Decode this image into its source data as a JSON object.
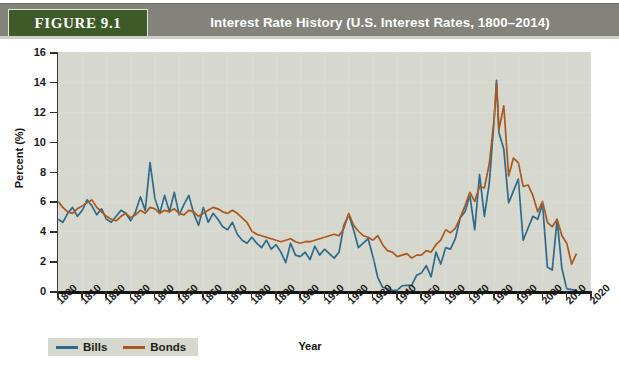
{
  "header": {
    "badge": "FIGURE 9.1",
    "title": "Interest Rate History (U.S. Interest Rates, 1800–2014)",
    "bar_color": "#83837b",
    "badge_color": "#3e5a28"
  },
  "legend": {
    "position": "bottom-left",
    "items": [
      {
        "label": "Bills",
        "color": "#2c6a8c"
      },
      {
        "label": "Bonds",
        "color": "#a9571f"
      }
    ]
  },
  "chart_data": {
    "type": "line",
    "title": "Interest Rate History (U.S. Interest Rates, 1800–2014)",
    "xlabel": "Year",
    "ylabel": "Percent (%)",
    "xlim": [
      1800,
      2020
    ],
    "ylim": [
      0,
      16
    ],
    "ytick_step": 2,
    "xtick_step": 10,
    "grid": false,
    "plot_bg": "#d6d7cd",
    "ytick_labels": [
      "0",
      "2",
      "4",
      "6",
      "8",
      "10",
      "12",
      "14",
      "16"
    ],
    "xtick_labels": [
      "1800",
      "1810",
      "1820",
      "1830",
      "1840",
      "1850",
      "1860",
      "1870",
      "1880",
      "1890",
      "1900",
      "1910",
      "1920",
      "1930",
      "1940",
      "1950",
      "1960",
      "1970",
      "1980",
      "1990",
      "2000",
      "2010",
      "2020"
    ],
    "series": [
      {
        "name": "Bills",
        "color": "#2c6a8c",
        "x": [
          1800,
          1802,
          1804,
          1806,
          1808,
          1810,
          1812,
          1814,
          1816,
          1818,
          1820,
          1822,
          1824,
          1826,
          1828,
          1830,
          1832,
          1834,
          1836,
          1838,
          1840,
          1842,
          1844,
          1846,
          1848,
          1850,
          1852,
          1854,
          1856,
          1858,
          1860,
          1862,
          1864,
          1866,
          1868,
          1870,
          1872,
          1874,
          1876,
          1878,
          1880,
          1882,
          1884,
          1886,
          1888,
          1890,
          1892,
          1894,
          1896,
          1898,
          1900,
          1902,
          1904,
          1906,
          1908,
          1910,
          1912,
          1914,
          1916,
          1918,
          1920,
          1922,
          1924,
          1926,
          1928,
          1930,
          1932,
          1934,
          1936,
          1938,
          1940,
          1942,
          1944,
          1946,
          1948,
          1950,
          1952,
          1954,
          1956,
          1958,
          1960,
          1962,
          1964,
          1966,
          1968,
          1970,
          1972,
          1974,
          1976,
          1978,
          1980,
          1981,
          1982,
          1984,
          1986,
          1988,
          1990,
          1992,
          1994,
          1996,
          1998,
          2000,
          2002,
          2004,
          2006,
          2008,
          2010,
          2012,
          2014
        ],
        "y": [
          4.8,
          4.6,
          5.2,
          5.6,
          5.0,
          5.4,
          6.1,
          5.7,
          5.1,
          5.5,
          4.8,
          4.6,
          5.0,
          5.4,
          5.2,
          4.7,
          5.3,
          6.3,
          5.4,
          8.6,
          6.2,
          5.2,
          6.4,
          5.3,
          6.6,
          5.1,
          5.8,
          6.4,
          5.2,
          4.4,
          5.6,
          4.6,
          5.2,
          4.8,
          4.3,
          4.1,
          4.6,
          3.8,
          3.4,
          3.2,
          3.6,
          3.2,
          2.9,
          3.4,
          2.8,
          3.1,
          2.6,
          1.9,
          3.2,
          2.4,
          2.3,
          2.6,
          2.1,
          3.0,
          2.4,
          2.8,
          2.5,
          2.2,
          2.6,
          4.4,
          5.1,
          4.1,
          2.9,
          3.2,
          3.5,
          2.3,
          0.9,
          0.25,
          0.15,
          0.05,
          0.05,
          0.35,
          0.38,
          0.38,
          1.05,
          1.2,
          1.7,
          0.95,
          2.6,
          1.8,
          2.9,
          2.8,
          3.5,
          4.9,
          5.3,
          6.4,
          4.1,
          7.8,
          5.0,
          7.2,
          11.4,
          14.1,
          10.6,
          9.5,
          5.9,
          6.7,
          7.5,
          3.4,
          4.2,
          5.0,
          4.8,
          5.8,
          1.6,
          1.4,
          4.8,
          1.5,
          0.14,
          0.09,
          0.04
        ]
      },
      {
        "name": "Bonds",
        "color": "#a9571f",
        "x": [
          1800,
          1802,
          1804,
          1806,
          1808,
          1810,
          1812,
          1814,
          1816,
          1818,
          1820,
          1822,
          1824,
          1826,
          1828,
          1830,
          1832,
          1834,
          1836,
          1838,
          1840,
          1842,
          1844,
          1846,
          1848,
          1850,
          1852,
          1854,
          1856,
          1858,
          1860,
          1862,
          1864,
          1866,
          1868,
          1870,
          1872,
          1874,
          1876,
          1878,
          1880,
          1882,
          1884,
          1886,
          1888,
          1890,
          1892,
          1894,
          1896,
          1898,
          1900,
          1902,
          1904,
          1906,
          1908,
          1910,
          1912,
          1914,
          1916,
          1918,
          1920,
          1922,
          1924,
          1926,
          1928,
          1930,
          1932,
          1934,
          1936,
          1938,
          1940,
          1942,
          1944,
          1946,
          1948,
          1950,
          1952,
          1954,
          1956,
          1958,
          1960,
          1962,
          1964,
          1966,
          1968,
          1970,
          1972,
          1974,
          1976,
          1978,
          1980,
          1981,
          1982,
          1984,
          1986,
          1988,
          1990,
          1992,
          1994,
          1996,
          1998,
          2000,
          2002,
          2004,
          2006,
          2008,
          2010,
          2012,
          2014
        ],
        "y": [
          6.0,
          5.6,
          5.3,
          5.2,
          5.5,
          5.7,
          5.9,
          6.1,
          5.6,
          5.3,
          5.0,
          4.8,
          4.7,
          5.0,
          5.2,
          4.9,
          5.1,
          5.4,
          5.2,
          5.6,
          5.5,
          5.2,
          5.4,
          5.3,
          5.5,
          5.2,
          5.1,
          5.4,
          5.3,
          5.0,
          5.2,
          5.4,
          5.6,
          5.5,
          5.3,
          5.2,
          5.4,
          5.2,
          4.9,
          4.6,
          4.0,
          3.8,
          3.7,
          3.6,
          3.5,
          3.4,
          3.3,
          3.4,
          3.5,
          3.3,
          3.2,
          3.3,
          3.3,
          3.4,
          3.5,
          3.6,
          3.7,
          3.8,
          3.7,
          4.2,
          5.2,
          4.4,
          4.0,
          3.7,
          3.6,
          3.4,
          3.7,
          3.1,
          2.7,
          2.6,
          2.3,
          2.4,
          2.5,
          2.2,
          2.4,
          2.4,
          2.7,
          2.6,
          3.1,
          3.4,
          4.1,
          3.9,
          4.2,
          4.9,
          5.7,
          6.6,
          6.0,
          7.0,
          6.9,
          8.5,
          11.5,
          13.9,
          10.8,
          12.4,
          7.7,
          8.9,
          8.6,
          7.0,
          7.1,
          6.4,
          5.3,
          6.0,
          4.6,
          4.3,
          4.8,
          3.7,
          3.2,
          1.8,
          2.5
        ]
      }
    ],
    "annotations": [
      {
        "text": "Bills spike",
        "year": 1838,
        "value": 8.6
      },
      {
        "text": "Peak rates",
        "year": 1981,
        "value": 14.1
      },
      {
        "text": "Near-zero bills",
        "year": 1940,
        "value": 0.05
      },
      {
        "text": "Near-zero bills",
        "year": 2012,
        "value": 0.09
      }
    ]
  }
}
